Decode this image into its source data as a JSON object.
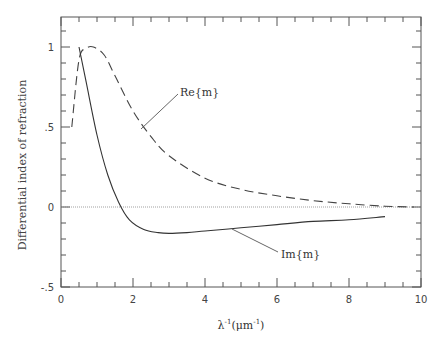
{
  "chart_data": {
    "type": "line",
    "title": "",
    "xlabel": "λ⁻¹(μm⁻¹)",
    "ylabel": "Differential index of refraction",
    "xlim": [
      0,
      10
    ],
    "ylim": [
      -0.5,
      1.2
    ],
    "x_ticks": [
      "0",
      "2",
      "4",
      "6",
      "8",
      "10"
    ],
    "y_ticks": [
      "-.5",
      "0",
      ".5",
      "1"
    ],
    "grid": false,
    "legend": "inline annotations",
    "reference_line": {
      "y": 0,
      "style": "dotted"
    },
    "series": [
      {
        "name": "Re{m}",
        "style": "dashed",
        "x": [
          0.3,
          0.5,
          0.7,
          0.9,
          1.2,
          1.5,
          2.0,
          2.5,
          3.0,
          4.0,
          5.0,
          6.0,
          7.0,
          8.0,
          9.0,
          9.8
        ],
        "values": [
          0.5,
          0.92,
          0.99,
          1.0,
          0.95,
          0.82,
          0.6,
          0.44,
          0.32,
          0.18,
          0.11,
          0.07,
          0.04,
          0.02,
          0.005,
          0.0
        ]
      },
      {
        "name": "Im{m}",
        "style": "solid",
        "x": [
          0.5,
          0.7,
          1.0,
          1.3,
          1.6,
          1.9,
          2.3,
          2.7,
          3.0,
          3.5,
          4.0,
          5.0,
          6.0,
          7.0,
          8.0,
          9.0
        ],
        "values": [
          1.0,
          0.78,
          0.45,
          0.2,
          0.03,
          -0.08,
          -0.14,
          -0.16,
          -0.165,
          -0.16,
          -0.15,
          -0.13,
          -0.11,
          -0.09,
          -0.08,
          -0.06
        ]
      }
    ],
    "annotations": [
      {
        "text": "Re{m}",
        "x": 2.5,
        "y": 0.55
      },
      {
        "text": "Im{m}",
        "x": 6.8,
        "y": -0.3
      }
    ]
  },
  "labels": {
    "ylabel": "Differential index of refraction",
    "xlabel_main": "λ",
    "xlabel_sup1": "-1",
    "xlabel_unit": "(μm",
    "xlabel_sup2": "-1",
    "xlabel_close": ")",
    "re_annot": "Re{m}",
    "im_annot": "Im{m}"
  }
}
